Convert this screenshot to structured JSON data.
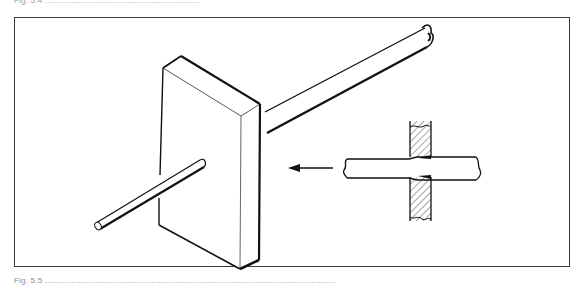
{
  "figure": {
    "caption_top": "Fig. 5.4 ................................................................",
    "caption_bottom": "Fig. 5.5 ........................................................................................................................",
    "caption_note": "captions are illegible at source resolution",
    "illustration": {
      "subject": "rectangular block with a rod passing through it, with an inset cross-section detail",
      "elements": [
        "rectangular-block",
        "rod-front-segment",
        "rod-rear-segment",
        "direction-arrow",
        "cross-section-rod",
        "cross-section-wall-hatched"
      ],
      "arrow_direction": "left",
      "colors": {
        "ink": "#111111",
        "frame": "#3a3a3a",
        "background": "#ffffff"
      }
    }
  }
}
